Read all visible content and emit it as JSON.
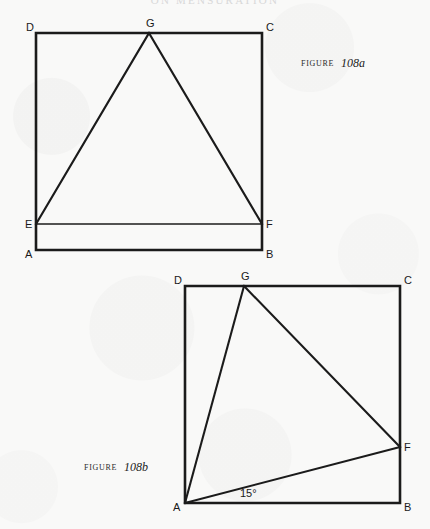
{
  "page": {
    "running_head": "ON  MENSURATION",
    "background_color": "#f9f9f8",
    "ink_color": "#1b1b1b"
  },
  "figures": [
    {
      "id": "108a",
      "caption_word": "FIGURE",
      "caption_number": "108a",
      "description": "Square ABCD with points E and F on the left and right sides and apex G on the top side; triangle EGF inscribed.",
      "square": {
        "A": [
          36,
          250
        ],
        "B": [
          262,
          250
        ],
        "C": [
          262,
          33
        ],
        "D": [
          36,
          33
        ]
      },
      "points": {
        "E": [
          36,
          224
        ],
        "F": [
          262,
          224
        ],
        "G": [
          149,
          33
        ]
      },
      "segments": [
        "AB",
        "BC",
        "CD",
        "DA",
        "EF",
        "EG",
        "GF"
      ],
      "vertex_labels": [
        {
          "text": "D",
          "x": 26,
          "y": 31
        },
        {
          "text": "G",
          "x": 146,
          "y": 27
        },
        {
          "text": "C",
          "x": 266,
          "y": 31
        },
        {
          "text": "E",
          "x": 25,
          "y": 228
        },
        {
          "text": "F",
          "x": 266,
          "y": 228
        },
        {
          "text": "A",
          "x": 25,
          "y": 258
        },
        {
          "text": "B",
          "x": 266,
          "y": 258
        }
      ],
      "caption_position": {
        "word_x": 301,
        "number_x": 341,
        "y": 66
      }
    },
    {
      "id": "108b",
      "caption_word": "FIGURE",
      "caption_number": "108b",
      "description": "Square ABCD with G on the top side and F on the right side; segments AG, GF and AF drawn, with a 15 degree angle at A between AF and AB.",
      "square": {
        "A": [
          185,
          503
        ],
        "B": [
          400,
          503
        ],
        "C": [
          400,
          286
        ],
        "D": [
          185,
          286
        ]
      },
      "points": {
        "G": [
          244,
          286
        ],
        "F": [
          400,
          447
        ]
      },
      "segments": [
        "AB",
        "BC",
        "CD",
        "DA",
        "AG",
        "GF",
        "AF"
      ],
      "angle_label": {
        "text": "15°",
        "x": 240,
        "y": 497
      },
      "vertex_labels": [
        {
          "text": "D",
          "x": 174,
          "y": 284
        },
        {
          "text": "G",
          "x": 241,
          "y": 280
        },
        {
          "text": "C",
          "x": 404,
          "y": 284
        },
        {
          "text": "F",
          "x": 404,
          "y": 451
        },
        {
          "text": "A",
          "x": 173,
          "y": 511
        },
        {
          "text": "B",
          "x": 404,
          "y": 511
        }
      ],
      "caption_position": {
        "word_x": 84,
        "number_x": 124,
        "y": 470
      }
    }
  ]
}
